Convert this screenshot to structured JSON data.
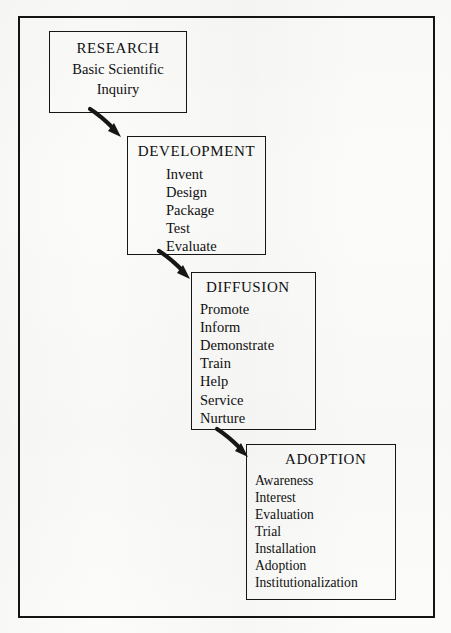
{
  "diagram": {
    "background_color": "#fbfbfa",
    "ink_color": "#141414",
    "stages": [
      {
        "id": "research",
        "title": "RESEARCH",
        "subtitle_lines": [
          "Basic Scientific",
          "Inquiry"
        ],
        "items": []
      },
      {
        "id": "development",
        "title": "DEVELOPMENT",
        "subtitle_lines": [],
        "items": [
          "Invent",
          "Design",
          "Package",
          "Test",
          "Evaluate"
        ]
      },
      {
        "id": "diffusion",
        "title": "DIFFUSION",
        "subtitle_lines": [],
        "items": [
          "Promote",
          "Inform",
          "Demonstrate",
          "Train",
          "Help",
          "Service",
          "Nurture"
        ]
      },
      {
        "id": "adoption",
        "title": "ADOPTION",
        "subtitle_lines": [],
        "items": [
          "Awareness",
          "Interest",
          "Evaluation",
          "Trial",
          "Installation",
          "Adoption",
          "Institutionalization"
        ]
      }
    ],
    "arrows": [
      {
        "id": "research-to-development",
        "from": "RESEARCH",
        "to": "DEVELOPMENT",
        "direction": "down-right"
      },
      {
        "id": "development-to-diffusion",
        "from": "DEVELOPMENT",
        "to": "DIFFUSION",
        "direction": "down-right"
      },
      {
        "id": "diffusion-to-adoption",
        "from": "DIFFUSION",
        "to": "ADOPTION",
        "direction": "down-right"
      }
    ]
  }
}
